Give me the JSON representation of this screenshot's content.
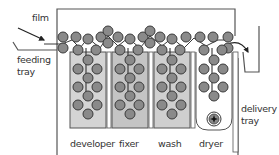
{
  "diagram": {
    "labels": {
      "film": "film",
      "feeding_tray": [
        "feeding",
        "tray"
      ],
      "delivery_tray": [
        "delivery",
        "tray"
      ],
      "tanks": [
        "developer",
        "fixer",
        "wash",
        "dryer"
      ]
    },
    "colors": {
      "roller_fill": "#8a8a8a",
      "roller_stroke": "#3a3a3a",
      "tank_fill_developer": "#d4d4d4",
      "tank_fill_fixer": "#c4c4c4",
      "tank_fill_wash": "#cfcfcf",
      "tank_fill_dryer": "#ffffff",
      "line": "#555555"
    },
    "tanks": [
      {
        "name": "developer",
        "x": 70,
        "w": 36
      },
      {
        "name": "fixer",
        "x": 112,
        "w": 36
      },
      {
        "name": "wash",
        "x": 154,
        "w": 36
      },
      {
        "name": "dryer",
        "x": 196,
        "w": 36
      }
    ]
  }
}
